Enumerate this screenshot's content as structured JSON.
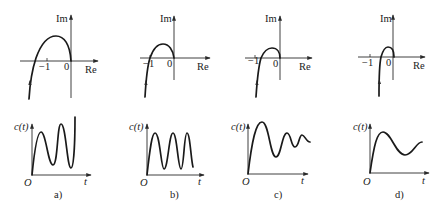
{
  "figure": {
    "panels": [
      {
        "id": "a",
        "caption": "a)",
        "nyquist": {
          "im_label": "Im",
          "re_label": "Re",
          "tick_minus_one": "−1",
          "tick_zero": "0",
          "crossing": "left of -1 (encircles -1)"
        },
        "step": {
          "y_label": "c(t)",
          "x_label": "t",
          "origin_label": "O",
          "behavior": "divergent oscillation"
        }
      },
      {
        "id": "b",
        "caption": "b)",
        "nyquist": {
          "im_label": "Im",
          "re_label": "Re",
          "tick_minus_one": "−1",
          "tick_zero": "0",
          "crossing": "passes through -1"
        },
        "step": {
          "y_label": "c(t)",
          "x_label": "t",
          "origin_label": "O",
          "behavior": "sustained (constant amplitude) oscillation"
        }
      },
      {
        "id": "c",
        "caption": "c)",
        "nyquist": {
          "im_label": "Im",
          "re_label": "Re",
          "tick_minus_one": "−1",
          "tick_zero": "0",
          "crossing": "right of -1, close"
        },
        "step": {
          "y_label": "c(t)",
          "x_label": "t",
          "origin_label": "O",
          "behavior": "lightly damped oscillation"
        }
      },
      {
        "id": "d",
        "caption": "d)",
        "nyquist": {
          "im_label": "Im",
          "re_label": "Re",
          "tick_minus_one": "−1",
          "tick_zero": "0",
          "crossing": "right of -1, far"
        },
        "step": {
          "y_label": "c(t)",
          "x_label": "t",
          "origin_label": "O",
          "behavior": "well damped response"
        }
      }
    ]
  },
  "colors": {
    "line": "#1a1a1a",
    "axis": "#2a2a2a",
    "background": "#ffffff"
  }
}
